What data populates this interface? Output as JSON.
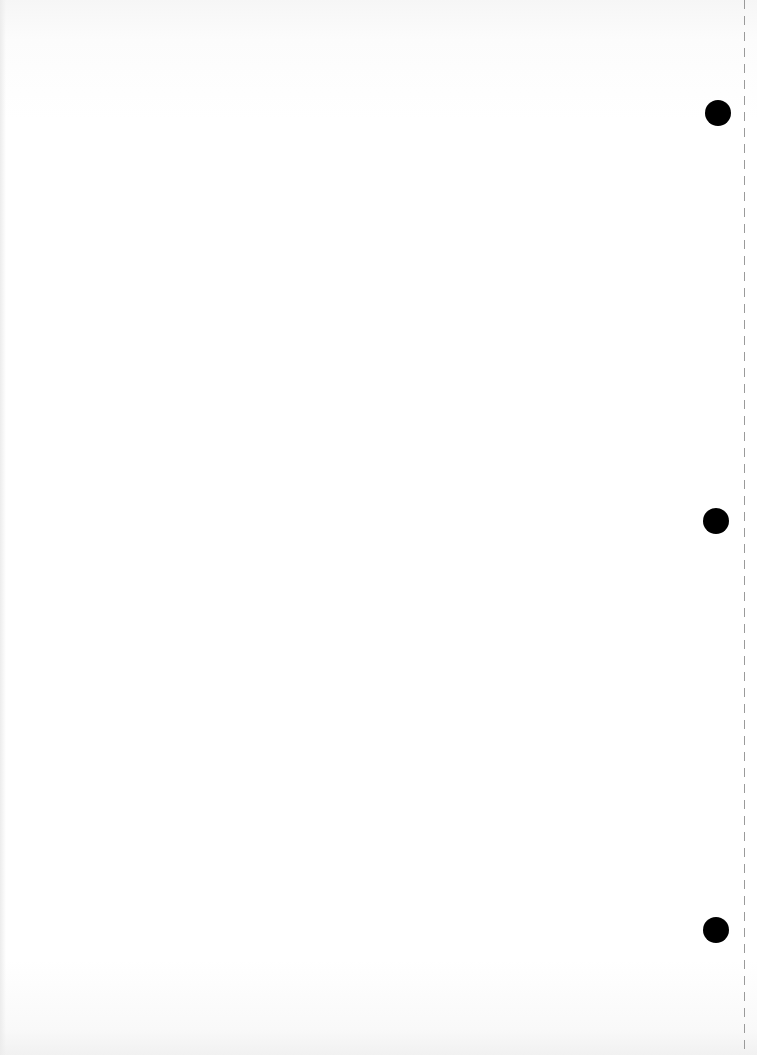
{
  "document": {
    "type": "blank-punched-sheet",
    "body_text": "",
    "faint_show_through_text": ""
  },
  "punch_holes": [
    {
      "cx": 718,
      "cy": 113,
      "r": 13
    },
    {
      "cx": 716,
      "cy": 521,
      "r": 13
    },
    {
      "cx": 716,
      "cy": 930,
      "r": 13
    }
  ],
  "perforation": {
    "x": 744,
    "style": "dashed",
    "color": "#9a9a9a"
  },
  "colors": {
    "paper": "#ffffff",
    "hole": "#000000"
  }
}
